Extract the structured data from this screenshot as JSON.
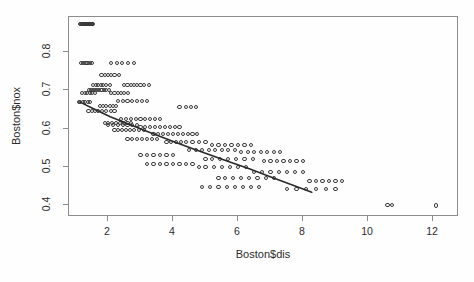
{
  "figure": {
    "background_color": "#fefefe",
    "frame_color": "#8d8d8d",
    "point_color": "#3a3a3a",
    "line_color": "#2a2a2a"
  },
  "axis": {
    "x_label": "Boston$dis",
    "y_label": "Boston$nox",
    "x_ticks": [
      "2",
      "4",
      "6",
      "8",
      "10",
      "12"
    ],
    "y_ticks": [
      "0.4",
      "0.5",
      "0.6",
      "0.7",
      "0.8"
    ]
  },
  "chart_data": {
    "type": "scatter",
    "title": "",
    "xlabel": "Boston$dis",
    "ylabel": "Boston$nox",
    "xlim": [
      0.8,
      12.8
    ],
    "ylim": [
      0.37,
      0.89
    ],
    "xticks": [
      2,
      4,
      6,
      8,
      10,
      12
    ],
    "yticks": [
      0.4,
      0.5,
      0.6,
      0.7,
      0.8
    ],
    "grid": false,
    "legend": null,
    "marker": "open-circle",
    "series": [
      {
        "name": "Boston nox vs dis",
        "x": [
          1.13,
          1.17,
          1.2,
          1.22,
          1.25,
          1.28,
          1.32,
          1.35,
          1.38,
          1.41,
          1.43,
          1.46,
          1.49,
          1.52,
          1.55,
          1.18,
          1.24,
          1.31,
          1.37,
          1.44,
          1.51,
          2.1,
          2.28,
          2.42,
          2.62,
          2.8,
          1.8,
          1.9,
          2.0,
          2.1,
          2.2,
          2.35,
          1.55,
          1.62,
          1.7,
          1.78,
          1.85,
          1.95,
          2.05,
          2.5,
          2.6,
          2.7,
          2.8,
          2.9,
          3.0,
          3.1,
          3.25,
          1.42,
          1.48,
          1.55,
          1.6,
          1.66,
          1.72,
          1.8,
          1.88,
          1.95,
          2.02,
          1.2,
          1.28,
          1.36,
          1.44,
          1.52,
          1.6,
          2.1,
          2.2,
          2.3,
          2.4,
          2.5,
          2.62,
          1.1,
          1.15,
          1.22,
          1.3,
          1.38,
          1.45,
          2.3,
          2.45,
          2.6,
          2.75,
          2.9,
          3.05,
          3.2,
          4.2,
          4.4,
          4.55,
          4.7,
          1.4,
          1.5,
          1.6,
          1.7,
          1.82,
          1.95,
          2.08,
          2.2,
          2.4,
          2.55,
          2.7,
          2.85,
          3.0,
          3.15,
          3.3,
          3.45,
          3.6,
          1.9,
          2.0,
          2.12,
          2.24,
          2.36,
          2.48,
          2.6,
          2.72,
          3.0,
          3.15,
          3.3,
          3.45,
          3.6,
          3.75,
          3.9,
          4.05,
          4.2,
          2.2,
          2.3,
          2.42,
          2.55,
          2.68,
          2.8,
          2.95,
          3.1,
          3.4,
          3.55,
          3.7,
          3.85,
          4.0,
          4.15,
          4.3,
          4.45,
          4.6,
          4.75,
          2.6,
          2.75,
          2.9,
          3.05,
          3.2,
          3.35,
          3.5,
          3.8,
          3.95,
          4.1,
          4.25,
          4.4,
          4.6,
          4.8,
          5.0,
          5.2,
          5.4,
          5.6,
          5.8,
          6.0,
          6.2,
          6.4,
          4.5,
          4.7,
          4.9,
          5.1,
          5.3,
          5.5,
          5.7,
          5.9,
          6.1,
          6.3,
          6.5,
          6.7,
          6.9,
          7.1,
          7.3,
          5.0,
          5.2,
          5.45,
          5.7,
          5.95,
          6.2,
          6.45,
          6.8,
          7.0,
          7.2,
          7.4,
          7.6,
          7.8,
          8.0,
          3.2,
          3.4,
          3.6,
          3.8,
          4.0,
          4.2,
          4.4,
          4.6,
          4.8,
          5.0,
          5.25,
          5.5,
          5.75,
          6.0,
          6.25,
          6.5,
          6.75,
          7.0,
          7.25,
          7.5,
          7.75,
          8.0,
          8.2,
          8.4,
          8.6,
          8.8,
          9.0,
          9.2,
          7.5,
          7.8,
          8.1,
          8.4,
          8.7,
          9.0,
          10.6,
          10.75,
          12.1,
          5.4,
          5.6,
          5.85,
          6.1,
          6.35,
          6.6,
          6.85,
          7.1,
          3.0,
          3.2,
          3.4,
          3.6,
          3.8,
          4.0,
          2.0,
          2.15,
          2.3,
          2.45,
          2.6,
          2.75,
          2.9,
          1.75,
          1.85,
          1.95,
          2.05,
          2.15,
          2.25,
          4.9,
          5.15,
          5.4,
          5.65,
          5.9,
          6.15,
          6.4,
          6.65
        ],
        "y": [
          0.871,
          0.871,
          0.871,
          0.871,
          0.871,
          0.871,
          0.871,
          0.871,
          0.871,
          0.871,
          0.871,
          0.871,
          0.871,
          0.871,
          0.871,
          0.77,
          0.77,
          0.77,
          0.77,
          0.77,
          0.77,
          0.77,
          0.77,
          0.77,
          0.77,
          0.77,
          0.74,
          0.74,
          0.74,
          0.74,
          0.74,
          0.74,
          0.713,
          0.713,
          0.713,
          0.713,
          0.713,
          0.713,
          0.713,
          0.713,
          0.713,
          0.713,
          0.713,
          0.713,
          0.713,
          0.713,
          0.713,
          0.7,
          0.7,
          0.7,
          0.7,
          0.7,
          0.7,
          0.7,
          0.7,
          0.7,
          0.7,
          0.693,
          0.693,
          0.693,
          0.693,
          0.693,
          0.693,
          0.693,
          0.693,
          0.693,
          0.693,
          0.693,
          0.693,
          0.668,
          0.668,
          0.668,
          0.668,
          0.668,
          0.668,
          0.671,
          0.671,
          0.671,
          0.671,
          0.671,
          0.671,
          0.671,
          0.655,
          0.655,
          0.655,
          0.655,
          0.645,
          0.645,
          0.645,
          0.645,
          0.645,
          0.645,
          0.645,
          0.645,
          0.624,
          0.624,
          0.624,
          0.624,
          0.624,
          0.624,
          0.624,
          0.624,
          0.624,
          0.614,
          0.614,
          0.614,
          0.614,
          0.614,
          0.614,
          0.614,
          0.614,
          0.605,
          0.605,
          0.605,
          0.605,
          0.605,
          0.605,
          0.605,
          0.605,
          0.605,
          0.597,
          0.597,
          0.597,
          0.597,
          0.597,
          0.597,
          0.597,
          0.597,
          0.585,
          0.585,
          0.585,
          0.585,
          0.585,
          0.585,
          0.585,
          0.585,
          0.585,
          0.585,
          0.573,
          0.573,
          0.573,
          0.573,
          0.573,
          0.573,
          0.573,
          0.565,
          0.565,
          0.565,
          0.565,
          0.565,
          0.565,
          0.565,
          0.565,
          0.558,
          0.558,
          0.558,
          0.558,
          0.558,
          0.558,
          0.558,
          0.544,
          0.544,
          0.544,
          0.544,
          0.544,
          0.544,
          0.544,
          0.544,
          0.538,
          0.538,
          0.538,
          0.538,
          0.538,
          0.538,
          0.538,
          0.52,
          0.52,
          0.52,
          0.52,
          0.52,
          0.52,
          0.52,
          0.515,
          0.515,
          0.515,
          0.515,
          0.515,
          0.515,
          0.515,
          0.507,
          0.507,
          0.507,
          0.507,
          0.507,
          0.507,
          0.507,
          0.507,
          0.499,
          0.499,
          0.499,
          0.499,
          0.499,
          0.499,
          0.499,
          0.488,
          0.488,
          0.488,
          0.488,
          0.488,
          0.488,
          0.488,
          0.464,
          0.464,
          0.464,
          0.464,
          0.464,
          0.464,
          0.442,
          0.442,
          0.442,
          0.442,
          0.442,
          0.442,
          0.401,
          0.401,
          0.4,
          0.472,
          0.472,
          0.472,
          0.472,
          0.472,
          0.472,
          0.472,
          0.472,
          0.532,
          0.532,
          0.532,
          0.532,
          0.532,
          0.532,
          0.609,
          0.609,
          0.609,
          0.609,
          0.609,
          0.609,
          0.609,
          0.659,
          0.659,
          0.659,
          0.659,
          0.659,
          0.659,
          0.448,
          0.448,
          0.448,
          0.448,
          0.448,
          0.448,
          0.448,
          0.448
        ]
      }
    ],
    "fit_line": {
      "name": "fitted trend",
      "type": "line",
      "x": [
        1.17,
        1.6,
        2.1,
        2.6,
        3.1,
        3.6,
        4.1,
        4.6,
        5.2,
        5.8,
        6.4,
        7.0,
        7.6,
        8.3
      ],
      "y": [
        0.666,
        0.648,
        0.628,
        0.611,
        0.594,
        0.578,
        0.562,
        0.546,
        0.528,
        0.51,
        0.492,
        0.473,
        0.454,
        0.432
      ]
    }
  }
}
